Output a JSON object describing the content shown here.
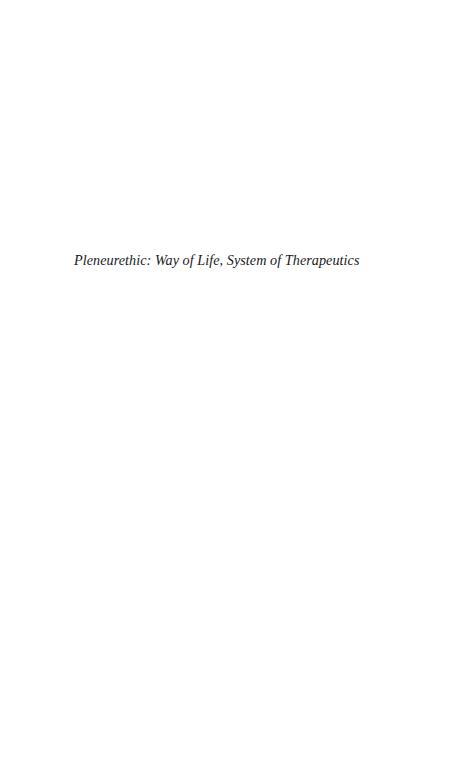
{
  "page": {
    "background": "#ffffff",
    "half_title": "Pleneurethic: Way of Life, System of Therapeutics"
  }
}
